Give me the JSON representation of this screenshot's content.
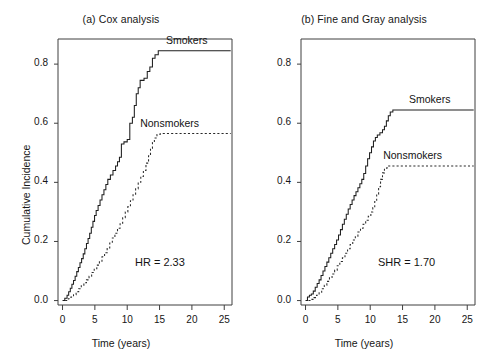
{
  "figure": {
    "background": "#ffffff",
    "panels": [
      {
        "id": "a",
        "title": "(a) Cox analysis",
        "stat_text": "HR = 2.33"
      },
      {
        "id": "b",
        "title": "(b) Fine and Gray analysis",
        "stat_text": "SHR = 1.70"
      }
    ]
  },
  "axes": {
    "xlabel": "Time (years)",
    "ylabel": "Cumulative Incidence",
    "xticks": [
      0,
      5,
      10,
      15,
      20,
      25
    ],
    "xtick_labels": [
      "0",
      "5",
      "10",
      "15",
      "20",
      "25"
    ],
    "yticks": [
      0.0,
      0.2,
      0.4,
      0.6,
      0.8
    ],
    "ytick_labels": [
      "0.0",
      "0.2",
      "0.4",
      "0.6",
      "0.8"
    ],
    "xlim": [
      -0.7,
      26.2
    ],
    "ylim": [
      -0.015,
      0.885
    ]
  },
  "legend": {
    "smokers": "Smokers",
    "nonsmokers": "Nonsmokers"
  },
  "chart_data": [
    {
      "type": "line",
      "id": "cox-analysis",
      "title": "(a) Cox analysis",
      "xlabel": "Time (years)",
      "ylabel": "Cumulative Incidence",
      "xlim": [
        -0.7,
        26.2
      ],
      "ylim": [
        -0.015,
        0.885
      ],
      "xticks": [
        0,
        5,
        10,
        15,
        20,
        25
      ],
      "yticks": [
        0.0,
        0.2,
        0.4,
        0.6,
        0.8
      ],
      "grid": false,
      "legend_position": "inline-right",
      "annotations": [
        "HR = 2.33"
      ],
      "series": [
        {
          "name": "Smokers",
          "style": "solid-step",
          "points": [
            [
              0.0,
              0.0
            ],
            [
              0.35,
              0.008
            ],
            [
              0.7,
              0.018
            ],
            [
              0.95,
              0.03
            ],
            [
              1.2,
              0.042
            ],
            [
              1.45,
              0.055
            ],
            [
              1.7,
              0.068
            ],
            [
              1.95,
              0.082
            ],
            [
              2.2,
              0.098
            ],
            [
              2.45,
              0.112
            ],
            [
              2.7,
              0.128
            ],
            [
              2.95,
              0.142
            ],
            [
              3.2,
              0.158
            ],
            [
              3.45,
              0.175
            ],
            [
              3.7,
              0.193
            ],
            [
              3.95,
              0.21
            ],
            [
              4.2,
              0.228
            ],
            [
              4.45,
              0.248
            ],
            [
              4.7,
              0.268
            ],
            [
              4.95,
              0.288
            ],
            [
              5.2,
              0.305
            ],
            [
              5.5,
              0.322
            ],
            [
              5.8,
              0.34
            ],
            [
              6.1,
              0.358
            ],
            [
              6.4,
              0.375
            ],
            [
              6.7,
              0.393
            ],
            [
              7.0,
              0.41
            ],
            [
              7.4,
              0.425
            ],
            [
              7.8,
              0.44
            ],
            [
              8.2,
              0.455
            ],
            [
              8.5,
              0.47
            ],
            [
              8.8,
              0.485
            ],
            [
              9.1,
              0.53
            ],
            [
              9.5,
              0.537
            ],
            [
              10.0,
              0.545
            ],
            [
              10.4,
              0.6
            ],
            [
              10.8,
              0.62
            ],
            [
              11.1,
              0.66
            ],
            [
              11.4,
              0.7
            ],
            [
              11.7,
              0.72
            ],
            [
              12.0,
              0.745
            ],
            [
              12.6,
              0.752
            ],
            [
              13.1,
              0.775
            ],
            [
              13.5,
              0.79
            ],
            [
              13.9,
              0.82
            ],
            [
              14.3,
              0.832
            ],
            [
              14.8,
              0.845
            ],
            [
              26.0,
              0.845
            ]
          ]
        },
        {
          "name": "Nonsmokers",
          "style": "dashed-step",
          "points": [
            [
              0.4,
              0.0
            ],
            [
              0.9,
              0.006
            ],
            [
              1.3,
              0.012
            ],
            [
              1.7,
              0.02
            ],
            [
              2.1,
              0.03
            ],
            [
              2.5,
              0.04
            ],
            [
              2.9,
              0.05
            ],
            [
              3.3,
              0.06
            ],
            [
              3.7,
              0.07
            ],
            [
              4.1,
              0.082
            ],
            [
              4.5,
              0.095
            ],
            [
              4.9,
              0.108
            ],
            [
              5.3,
              0.12
            ],
            [
              5.7,
              0.133
            ],
            [
              6.1,
              0.148
            ],
            [
              6.5,
              0.162
            ],
            [
              6.9,
              0.178
            ],
            [
              7.3,
              0.195
            ],
            [
              7.7,
              0.212
            ],
            [
              8.1,
              0.228
            ],
            [
              8.5,
              0.245
            ],
            [
              8.9,
              0.262
            ],
            [
              9.3,
              0.28
            ],
            [
              9.7,
              0.3
            ],
            [
              10.1,
              0.318
            ],
            [
              10.5,
              0.338
            ],
            [
              10.9,
              0.358
            ],
            [
              11.3,
              0.378
            ],
            [
              11.7,
              0.4
            ],
            [
              12.1,
              0.42
            ],
            [
              12.5,
              0.44
            ],
            [
              12.9,
              0.465
            ],
            [
              13.3,
              0.49
            ],
            [
              13.6,
              0.515
            ],
            [
              13.9,
              0.535
            ],
            [
              14.2,
              0.55
            ],
            [
              14.6,
              0.562
            ],
            [
              15.1,
              0.565
            ],
            [
              26.0,
              0.565
            ]
          ]
        }
      ]
    },
    {
      "type": "line",
      "id": "fine-and-gray-analysis",
      "title": "(b) Fine and Gray analysis",
      "xlabel": "Time (years)",
      "ylabel": "Cumulative Incidence",
      "xlim": [
        -0.7,
        26.2
      ],
      "ylim": [
        -0.015,
        0.885
      ],
      "xticks": [
        0,
        5,
        10,
        15,
        20,
        25
      ],
      "yticks": [
        0.0,
        0.2,
        0.4,
        0.6,
        0.8
      ],
      "grid": false,
      "legend_position": "inline-right",
      "annotations": [
        "SHR = 1.70"
      ],
      "series": [
        {
          "name": "Smokers",
          "style": "solid-step",
          "points": [
            [
              0.0,
              0.0
            ],
            [
              0.3,
              0.012
            ],
            [
              0.6,
              0.018
            ],
            [
              0.9,
              0.022
            ],
            [
              1.2,
              0.032
            ],
            [
              1.5,
              0.045
            ],
            [
              1.8,
              0.058
            ],
            [
              2.1,
              0.07
            ],
            [
              2.4,
              0.085
            ],
            [
              2.7,
              0.1
            ],
            [
              3.0,
              0.115
            ],
            [
              3.3,
              0.13
            ],
            [
              3.6,
              0.145
            ],
            [
              3.9,
              0.16
            ],
            [
              4.2,
              0.175
            ],
            [
              4.5,
              0.19
            ],
            [
              4.8,
              0.205
            ],
            [
              5.1,
              0.222
            ],
            [
              5.4,
              0.24
            ],
            [
              5.7,
              0.258
            ],
            [
              6.0,
              0.275
            ],
            [
              6.3,
              0.292
            ],
            [
              6.6,
              0.31
            ],
            [
              6.9,
              0.325
            ],
            [
              7.2,
              0.34
            ],
            [
              7.5,
              0.355
            ],
            [
              7.8,
              0.368
            ],
            [
              8.1,
              0.382
            ],
            [
              8.4,
              0.395
            ],
            [
              8.7,
              0.41
            ],
            [
              9.0,
              0.43
            ],
            [
              9.3,
              0.455
            ],
            [
              9.6,
              0.48
            ],
            [
              9.9,
              0.5
            ],
            [
              10.2,
              0.52
            ],
            [
              10.5,
              0.54
            ],
            [
              10.8,
              0.552
            ],
            [
              11.1,
              0.56
            ],
            [
              11.5,
              0.568
            ],
            [
              11.9,
              0.578
            ],
            [
              12.2,
              0.59
            ],
            [
              12.5,
              0.608
            ],
            [
              12.8,
              0.625
            ],
            [
              13.1,
              0.638
            ],
            [
              13.5,
              0.645
            ],
            [
              26.0,
              0.645
            ]
          ]
        },
        {
          "name": "Nonsmokers",
          "style": "dashed-step",
          "points": [
            [
              0.45,
              0.0
            ],
            [
              0.9,
              0.004
            ],
            [
              1.3,
              0.01
            ],
            [
              1.7,
              0.018
            ],
            [
              2.1,
              0.028
            ],
            [
              2.5,
              0.04
            ],
            [
              2.9,
              0.052
            ],
            [
              3.3,
              0.065
            ],
            [
              3.7,
              0.078
            ],
            [
              4.1,
              0.09
            ],
            [
              4.5,
              0.103
            ],
            [
              4.9,
              0.118
            ],
            [
              5.3,
              0.132
            ],
            [
              5.7,
              0.145
            ],
            [
              6.1,
              0.16
            ],
            [
              6.5,
              0.175
            ],
            [
              6.9,
              0.19
            ],
            [
              7.3,
              0.205
            ],
            [
              7.7,
              0.218
            ],
            [
              8.1,
              0.232
            ],
            [
              8.5,
              0.245
            ],
            [
              8.9,
              0.258
            ],
            [
              9.3,
              0.272
            ],
            [
              9.7,
              0.285
            ],
            [
              10.1,
              0.3
            ],
            [
              10.4,
              0.315
            ],
            [
              10.7,
              0.335
            ],
            [
              11.0,
              0.36
            ],
            [
              11.3,
              0.385
            ],
            [
              11.6,
              0.41
            ],
            [
              11.9,
              0.432
            ],
            [
              12.2,
              0.448
            ],
            [
              12.6,
              0.455
            ],
            [
              26.0,
              0.455
            ]
          ]
        }
      ]
    }
  ]
}
